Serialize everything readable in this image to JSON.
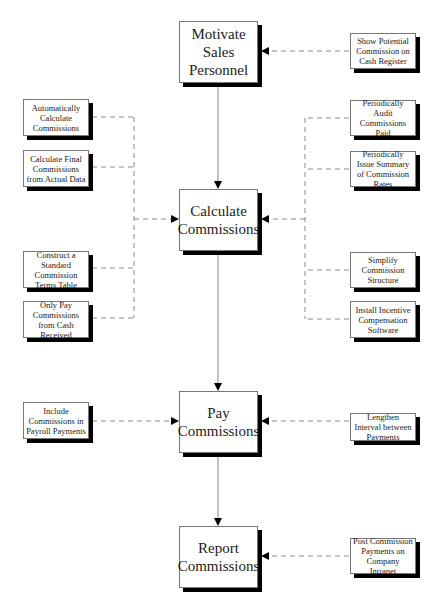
{
  "diagram": {
    "main_steps": [
      {
        "id": "motivate",
        "label": "Motivate Sales Personnel"
      },
      {
        "id": "calculate",
        "label": "Calculate Commissions"
      },
      {
        "id": "pay",
        "label": "Pay Commissions"
      },
      {
        "id": "report",
        "label": "Report Commissions"
      }
    ],
    "improvements": {
      "motivate_right": [
        "Show Potential Commission on Cash Register"
      ],
      "calculate_left": [
        "Automatically Calculate Commissions",
        "Calculate Final Commissions from Actual Data",
        "Construct a Standard Commission Terms Table",
        "Only Pay Commissions from Cash Received"
      ],
      "calculate_right": [
        "Periodically Audit Commissions Paid",
        "Periodically Issue Summary of Commission Rates",
        "Simplify Commission Structure",
        "Install Incentive Compensation Software"
      ],
      "pay_left": [
        "Include Commissions in Payroll Payments"
      ],
      "pay_right": [
        "Lengthen Interval between Payments"
      ],
      "report_right": [
        "Post Commission Payments on Company Intranet"
      ]
    },
    "colors": {
      "solid_line": "#9a9a9a",
      "dashed_line": "#8a8a8a",
      "shadow": "#000000",
      "box_border": "#777777"
    }
  }
}
